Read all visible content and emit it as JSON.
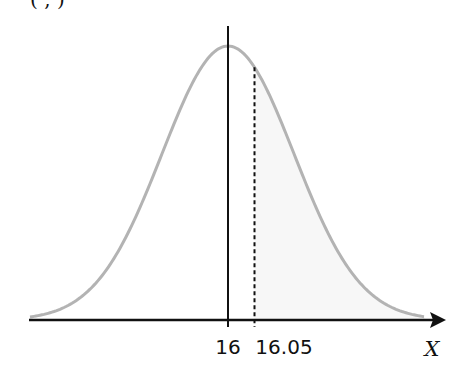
{
  "diagram": {
    "title_fragment": "(   ,      )",
    "x_axis_label": "X",
    "mean_label": "16",
    "value_label": "16.05",
    "colors": {
      "curve": "#b3b3b3",
      "axis": "#111111",
      "shade": "#f7f7f7",
      "mean_line": "#111111",
      "value_line": "#111111"
    }
  },
  "chart_data": {
    "type": "area",
    "xlabel": "X",
    "ylabel": "",
    "distribution": "normal",
    "mean": 16,
    "marked_value": 16.05,
    "tick_labels": [
      "16",
      "16.05"
    ],
    "shaded_region": "X > 16.05 (upper tail)",
    "annotations": [
      {
        "type": "solid_vertical_line",
        "at": 16
      },
      {
        "type": "dashed_vertical_line",
        "at": 16.05
      }
    ],
    "grid": false,
    "legend": "none"
  }
}
